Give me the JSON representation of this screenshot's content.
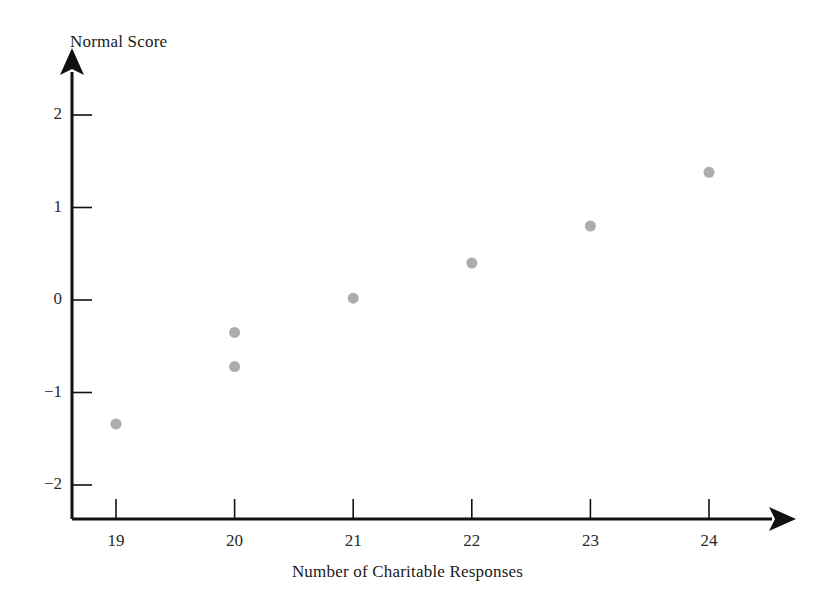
{
  "chart_data": {
    "type": "scatter",
    "title": "",
    "xlabel": "Number of Charitable Responses",
    "ylabel": "Normal Score",
    "xlim": [
      18.5,
      24.8
    ],
    "ylim": [
      -2.35,
      2.35
    ],
    "grid": false,
    "legend": null,
    "x_ticks": [
      19,
      20,
      21,
      22,
      23,
      24
    ],
    "x_tick_labels": [
      "19",
      "20",
      "21",
      "22",
      "23",
      "24"
    ],
    "y_ticks": [
      2,
      1,
      0,
      -1,
      -2
    ],
    "y_tick_labels": [
      "2",
      "1",
      "0",
      "−1",
      "−2"
    ],
    "series": [
      {
        "name": "Normal probability plot",
        "marker": "circle",
        "marker_color": "#acacac",
        "marker_size": 11,
        "points": [
          {
            "x": 19,
            "y": -1.34
          },
          {
            "x": 20,
            "y": -0.35
          },
          {
            "x": 20,
            "y": -0.72
          },
          {
            "x": 21,
            "y": 0.02
          },
          {
            "x": 22,
            "y": 0.4
          },
          {
            "x": 23,
            "y": 0.8
          },
          {
            "x": 24,
            "y": 1.38
          }
        ]
      }
    ],
    "axis_color": "#111111",
    "background_color": "#ffffff"
  }
}
